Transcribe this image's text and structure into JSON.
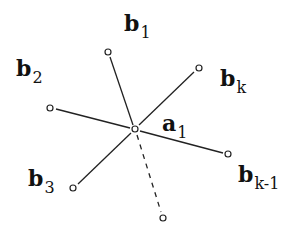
{
  "diagram": {
    "center": {
      "id": "a1",
      "base": "a",
      "sub": "1",
      "x": 135,
      "y": 129,
      "label_x": 162,
      "label_y": 112
    },
    "nodes": [
      {
        "id": "b1",
        "base": "b",
        "sub": "1",
        "x": 108,
        "y": 52,
        "label_x": 124,
        "label_y": 12,
        "edge": "solid"
      },
      {
        "id": "b2",
        "base": "b",
        "sub": "2",
        "x": 50,
        "y": 108,
        "label_x": 16,
        "label_y": 57,
        "edge": "solid"
      },
      {
        "id": "b3",
        "base": "b",
        "sub": "3",
        "x": 73,
        "y": 188,
        "label_x": 28,
        "label_y": 167,
        "edge": "solid"
      },
      {
        "id": "bk",
        "base": "b",
        "sub": "k",
        "x": 199,
        "y": 68,
        "label_x": 220,
        "label_y": 67,
        "edge": "solid"
      },
      {
        "id": "bk-1",
        "base": "b",
        "sub": "k-1",
        "x": 228,
        "y": 154,
        "label_x": 238,
        "label_y": 163,
        "edge": "solid"
      },
      {
        "id": "unlabeled",
        "base": "",
        "sub": "",
        "x": 163,
        "y": 218,
        "edge": "dashed"
      }
    ],
    "colors": {
      "stroke": "#222222",
      "background": "#ffffff"
    }
  }
}
